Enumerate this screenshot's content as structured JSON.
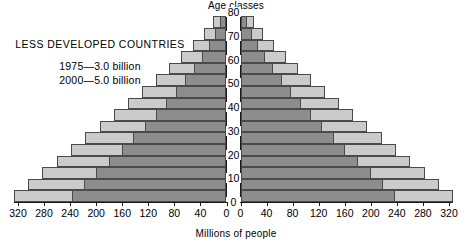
{
  "caption": {
    "title": "LESS DEVELOPED COUNTRIES",
    "legend": [
      "1975—3.0 billion",
      "2000—5.0 billion"
    ]
  },
  "axes": {
    "age_axis_title": "Age classes",
    "x_axis_title": "Millions of people",
    "age_ticks": [
      "0",
      "10",
      "20",
      "30",
      "40",
      "50",
      "60",
      "70",
      "80"
    ],
    "x_ticks_left": [
      "320",
      "280",
      "240",
      "200",
      "160",
      "120",
      "80",
      "40",
      "0"
    ],
    "x_ticks_right": [
      "0",
      "40",
      "80",
      "120",
      "160",
      "200",
      "240",
      "280",
      "320"
    ]
  },
  "colors": {
    "projection_2000": "#cbcbcb",
    "base_1975": "#8d8d8d",
    "outline": "#4a4a4a",
    "axis": "#1a1a1a",
    "background": "#ffffff"
  },
  "chart_data": {
    "type": "bar",
    "title": "LESS DEVELOPED COUNTRIES",
    "subtitle": "1975—3.0 billion / 2000—5.0 billion",
    "xlabel": "Millions of people",
    "ylabel": "Age classes",
    "xlim": [
      -320,
      320
    ],
    "ylim": [
      0,
      80
    ],
    "grid": false,
    "legend_position": "upper-left",
    "orientation": "population-pyramid",
    "note": "Mirrored horizontal bars. Left half = males, right half = females. Each age class spans 5 years. Dark bars show the 1975 population; light bars show the larger year-2000 projection behind them.",
    "categories": [
      "0-4",
      "5-9",
      "10-14",
      "15-19",
      "20-24",
      "25-29",
      "30-34",
      "35-39",
      "40-44",
      "45-49",
      "50-54",
      "55-59",
      "60-64",
      "65-69",
      "70-74",
      "75-79"
    ],
    "series": [
      {
        "name": "1975—3.0 billion",
        "color": "#8d8d8d",
        "side_left": [
          237,
          218,
          200,
          180,
          160,
          142,
          124,
          108,
          92,
          77,
          63,
          49,
          37,
          26,
          17,
          9
        ],
        "side_right": [
          237,
          218,
          200,
          180,
          160,
          142,
          124,
          108,
          92,
          77,
          63,
          49,
          37,
          26,
          17,
          9
        ]
      },
      {
        "name": "2000—5.0 billion",
        "color": "#cbcbcb",
        "side_left": [
          326,
          304,
          282,
          260,
          238,
          216,
          194,
          172,
          150,
          129,
          108,
          88,
          69,
          51,
          34,
          20
        ],
        "side_right": [
          326,
          304,
          282,
          260,
          238,
          216,
          194,
          172,
          150,
          129,
          108,
          88,
          69,
          51,
          34,
          20
        ]
      }
    ]
  }
}
